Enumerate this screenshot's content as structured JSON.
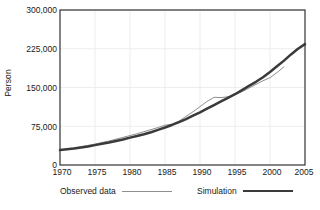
{
  "chart_data": {
    "type": "line",
    "title": "",
    "xlabel": "",
    "ylabel": "Person",
    "xlim": [
      1970,
      2005
    ],
    "ylim": [
      0,
      300000
    ],
    "grid": true,
    "legend_position": "bottom",
    "xticks": [
      "1970",
      "1975",
      "1980",
      "1985",
      "1990",
      "1995",
      "2000",
      "2005"
    ],
    "yticks": [
      "0",
      "75,000",
      "150,000",
      "225,000",
      "300,000"
    ],
    "series": [
      {
        "name": "Observed data",
        "color": "#8f8f8f",
        "line_width": 1,
        "x": [
          1970,
          1971,
          1972,
          1973,
          1974,
          1975,
          1976,
          1977,
          1978,
          1979,
          1980,
          1981,
          1982,
          1983,
          1984,
          1985,
          1986,
          1987,
          1988,
          1989,
          1990,
          1991,
          1992,
          1993,
          1994,
          1995,
          1996,
          1997,
          1998,
          1999,
          2000,
          2001,
          2002
        ],
        "values": [
          29000,
          31000,
          33000,
          35500,
          38000,
          40500,
          43500,
          46500,
          50000,
          53500,
          57000,
          60500,
          64500,
          68500,
          72500,
          77000,
          79000,
          85000,
          94000,
          103000,
          113000,
          123000,
          131000,
          130500,
          132000,
          136000,
          142000,
          149000,
          156000,
          163000,
          169000,
          179000,
          190000
        ]
      },
      {
        "name": "Simulation",
        "color": "#3a3a3a",
        "line_width": 2.5,
        "x": [
          1970,
          1971,
          1972,
          1973,
          1974,
          1975,
          1976,
          1977,
          1978,
          1979,
          1980,
          1981,
          1982,
          1983,
          1984,
          1985,
          1986,
          1987,
          1988,
          1989,
          1990,
          1991,
          1992,
          1993,
          1994,
          1995,
          1996,
          1997,
          1998,
          1999,
          2000,
          2001,
          2002,
          2003,
          2004,
          2005
        ],
        "values": [
          29000,
          30500,
          32000,
          34000,
          36000,
          38500,
          41000,
          43500,
          46500,
          49500,
          53000,
          56000,
          59500,
          63500,
          68000,
          72500,
          77500,
          83000,
          89000,
          95500,
          102000,
          109000,
          116000,
          123000,
          130000,
          137000,
          145000,
          153000,
          161000,
          170000,
          180000,
          191000,
          202000,
          214000,
          225000,
          234000
        ]
      }
    ]
  },
  "legend": {
    "observed_label": "Observed data",
    "simulation_label": "Simulation"
  },
  "colors": {
    "observed": "#8f8f8f",
    "simulation": "#3a3a3a",
    "axis": "#333333",
    "grid": "#ededed"
  }
}
